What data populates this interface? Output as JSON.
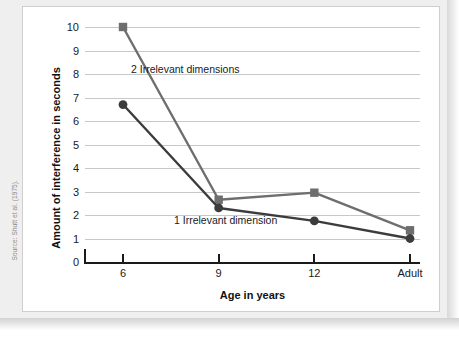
{
  "source_credit": "Source: Shutt et al. (1975).",
  "chart_data": {
    "type": "line",
    "title": "",
    "xlabel": "Age in years",
    "ylabel": "Amount of interference in seconds",
    "categories": [
      "6",
      "9",
      "12",
      "Adult"
    ],
    "ylim": [
      0,
      10
    ],
    "y_ticks": [
      "0",
      "1",
      "2",
      "3",
      "4",
      "5",
      "6",
      "7",
      "8",
      "9",
      "10"
    ],
    "grid": true,
    "legend_position": "inline-annotations",
    "series": [
      {
        "name": "2 Irrelevant dimensions",
        "marker": "square",
        "color": "#6e6e6e",
        "values": [
          10.0,
          2.65,
          2.95,
          1.35
        ]
      },
      {
        "name": "1 Irrelevant dimension",
        "marker": "circle",
        "color": "#3c3c3c",
        "values": [
          6.7,
          2.3,
          1.75,
          1.0
        ]
      }
    ],
    "annotations": [
      {
        "text": "2 Irrelevant dimensions",
        "series": 0
      },
      {
        "text": "1 Irrelevant dimension",
        "series": 1
      }
    ]
  }
}
